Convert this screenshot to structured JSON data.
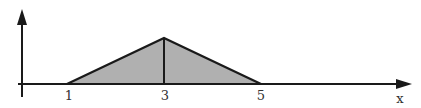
{
  "diagram": {
    "type": "triangular-distribution-plot",
    "x_axis_label": "x",
    "tick_labels": [
      "1",
      "3",
      "5"
    ],
    "shape": {
      "kind": "triangle",
      "left_x": 1,
      "peak_x": 3,
      "right_x": 5,
      "fill_color": "#b0b0b0",
      "stroke_color": "#1a1a1a"
    },
    "colors": {
      "axis": "#1a1a1a",
      "text": "#333333",
      "background": "#ffffff"
    }
  }
}
